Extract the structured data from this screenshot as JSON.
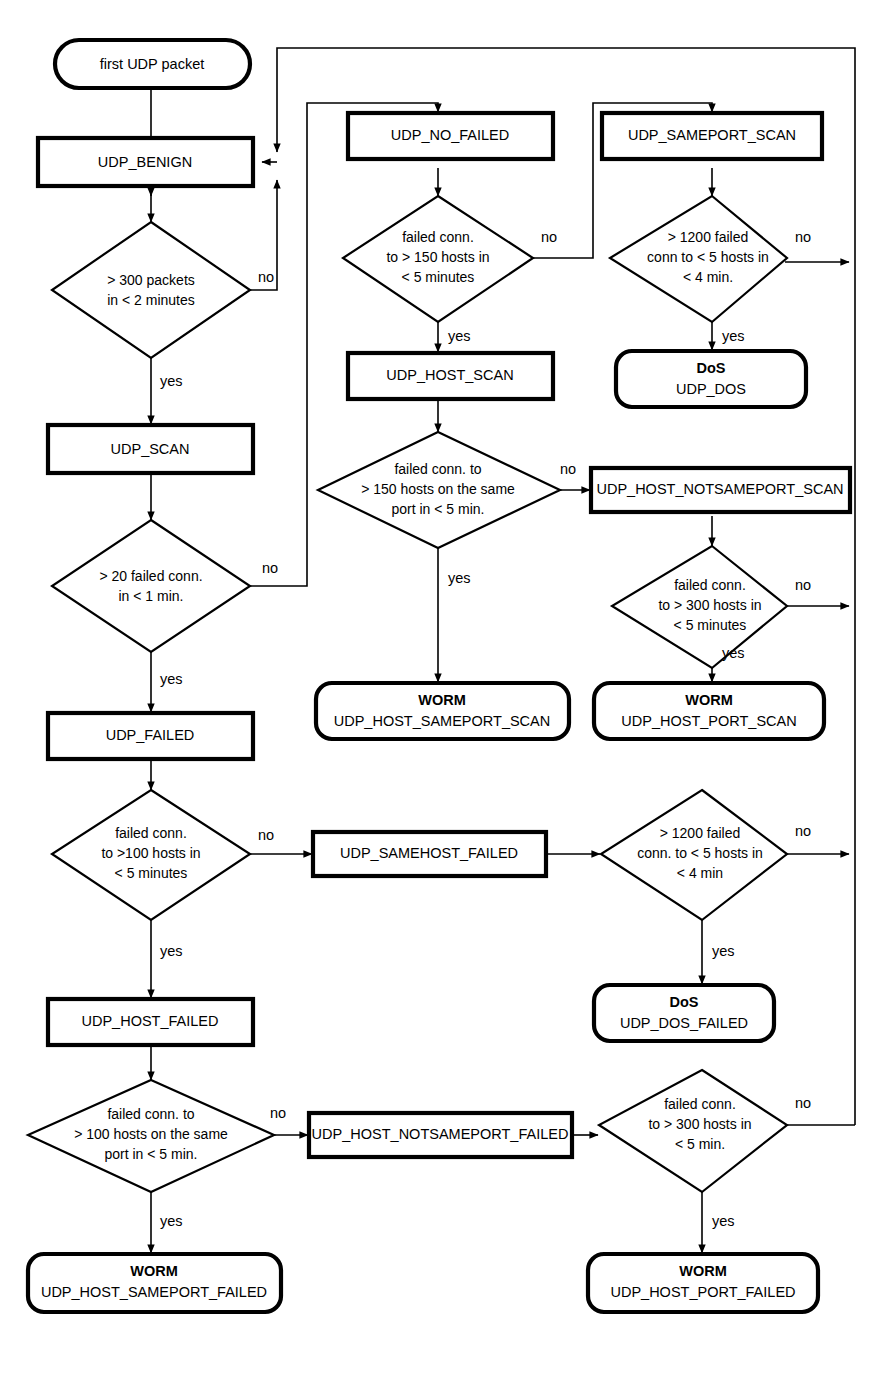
{
  "diagram": {
    "colors": {
      "stroke": "#000000",
      "fill": "#ffffff",
      "background": "#ffffff"
    },
    "edge_labels": {
      "yes": "yes",
      "no": "no"
    },
    "nodes": [
      {
        "id": "start",
        "kind": "terminator",
        "label": "first UDP packet",
        "sub": ""
      },
      {
        "id": "udp_benign",
        "kind": "state",
        "label": "UDP_BENIGN",
        "sub": ""
      },
      {
        "id": "d_300packets",
        "kind": "decision",
        "lines": [
          "> 300 packets",
          "in < 2 minutes"
        ]
      },
      {
        "id": "udp_scan",
        "kind": "state",
        "label": "UDP_SCAN",
        "sub": ""
      },
      {
        "id": "d_20failed",
        "kind": "decision",
        "lines": [
          "> 20 failed conn.",
          "in < 1 min."
        ]
      },
      {
        "id": "udp_failed",
        "kind": "state",
        "label": "UDP_FAILED",
        "sub": ""
      },
      {
        "id": "d_100hosts",
        "kind": "decision",
        "lines": [
          "failed conn.",
          "to >100 hosts in",
          "< 5 minutes"
        ]
      },
      {
        "id": "udp_host_failed",
        "kind": "state",
        "label": "UDP_HOST_FAILED",
        "sub": ""
      },
      {
        "id": "d_100sameport",
        "kind": "decision",
        "lines": [
          "failed conn. to",
          "> 100 hosts on the same",
          "port in < 5 min."
        ]
      },
      {
        "id": "worm_host_sameport_failed",
        "kind": "terminator",
        "label": "WORM",
        "sub": "UDP_HOST_SAMEPORT_FAILED"
      },
      {
        "id": "udp_samehost_failed",
        "kind": "state",
        "label": "UDP_SAMEHOST_FAILED",
        "sub": ""
      },
      {
        "id": "d_1200failed_b",
        "kind": "decision",
        "lines": [
          "> 1200 failed",
          "conn. to < 5 hosts in",
          "< 4 min"
        ]
      },
      {
        "id": "dos_failed",
        "kind": "terminator",
        "label": "DoS",
        "sub": "UDP_DOS_FAILED"
      },
      {
        "id": "udp_host_notsameport_failed",
        "kind": "state",
        "label": "UDP_HOST_NOTSAMEPORT_FAILED",
        "sub": ""
      },
      {
        "id": "d_300hosts_failed",
        "kind": "decision",
        "lines": [
          "failed conn.",
          "to > 300 hosts in",
          "< 5 min."
        ]
      },
      {
        "id": "worm_host_port_failed",
        "kind": "terminator",
        "label": "WORM",
        "sub": "UDP_HOST_PORT_FAILED"
      },
      {
        "id": "udp_no_failed",
        "kind": "state",
        "label": "UDP_NO_FAILED",
        "sub": ""
      },
      {
        "id": "d_150hosts",
        "kind": "decision",
        "lines": [
          "failed conn.",
          "to > 150 hosts in",
          "< 5 minutes"
        ]
      },
      {
        "id": "udp_host_scan",
        "kind": "state",
        "label": "UDP_HOST_SCAN",
        "sub": ""
      },
      {
        "id": "d_150sameport",
        "kind": "decision",
        "lines": [
          "failed conn. to",
          "> 150 hosts on the same",
          "port in < 5 min."
        ]
      },
      {
        "id": "worm_host_sameport_scan",
        "kind": "terminator",
        "label": "WORM",
        "sub": "UDP_HOST_SAMEPORT_SCAN"
      },
      {
        "id": "udp_sameport_scan",
        "kind": "state",
        "label": "UDP_SAMEPORT_SCAN",
        "sub": ""
      },
      {
        "id": "d_1200failed_a",
        "kind": "decision",
        "lines": [
          "> 1200 failed",
          "conn to < 5 hosts in",
          "< 4 min."
        ]
      },
      {
        "id": "dos",
        "kind": "terminator",
        "label": "DoS",
        "sub": "UDP_DOS"
      },
      {
        "id": "udp_host_notsameport_scan",
        "kind": "state",
        "label": "UDP_HOST_NOTSAMEPORT_SCAN",
        "sub": ""
      },
      {
        "id": "d_300hosts_scan",
        "kind": "decision",
        "lines": [
          "failed conn.",
          "to > 300 hosts in",
          "< 5 minutes"
        ]
      },
      {
        "id": "worm_host_port_scan",
        "kind": "terminator",
        "label": "WORM",
        "sub": "UDP_HOST_PORT_SCAN"
      }
    ],
    "edges": [
      {
        "from": "start",
        "to": "d_300packets",
        "label": ""
      },
      {
        "from": "d_300packets",
        "to": "udp_scan",
        "label": "yes"
      },
      {
        "from": "d_300packets",
        "to": "udp_benign",
        "label": "no"
      },
      {
        "from": "udp_scan",
        "to": "d_20failed",
        "label": ""
      },
      {
        "from": "d_20failed",
        "to": "udp_failed",
        "label": "yes"
      },
      {
        "from": "d_20failed",
        "to": "udp_no_failed",
        "label": "no"
      },
      {
        "from": "udp_failed",
        "to": "d_100hosts",
        "label": ""
      },
      {
        "from": "d_100hosts",
        "to": "udp_host_failed",
        "label": "yes"
      },
      {
        "from": "d_100hosts",
        "to": "udp_samehost_failed",
        "label": "no"
      },
      {
        "from": "udp_host_failed",
        "to": "d_100sameport",
        "label": ""
      },
      {
        "from": "d_100sameport",
        "to": "worm_host_sameport_failed",
        "label": "yes"
      },
      {
        "from": "d_100sameport",
        "to": "udp_host_notsameport_failed",
        "label": "no"
      },
      {
        "from": "udp_samehost_failed",
        "to": "d_1200failed_b",
        "label": ""
      },
      {
        "from": "d_1200failed_b",
        "to": "dos_failed",
        "label": "yes"
      },
      {
        "from": "d_1200failed_b",
        "to": "udp_benign",
        "label": "no"
      },
      {
        "from": "udp_host_notsameport_failed",
        "to": "d_300hosts_failed",
        "label": ""
      },
      {
        "from": "d_300hosts_failed",
        "to": "worm_host_port_failed",
        "label": "yes"
      },
      {
        "from": "d_300hosts_failed",
        "to": "udp_benign",
        "label": "no"
      },
      {
        "from": "udp_no_failed",
        "to": "d_150hosts",
        "label": ""
      },
      {
        "from": "d_150hosts",
        "to": "udp_host_scan",
        "label": "yes"
      },
      {
        "from": "d_150hosts",
        "to": "udp_sameport_scan",
        "label": "no"
      },
      {
        "from": "udp_host_scan",
        "to": "d_150sameport",
        "label": ""
      },
      {
        "from": "d_150sameport",
        "to": "worm_host_sameport_scan",
        "label": "yes"
      },
      {
        "from": "d_150sameport",
        "to": "udp_host_notsameport_scan",
        "label": "no"
      },
      {
        "from": "udp_sameport_scan",
        "to": "d_1200failed_a",
        "label": ""
      },
      {
        "from": "d_1200failed_a",
        "to": "dos",
        "label": "yes"
      },
      {
        "from": "d_1200failed_a",
        "to": "udp_benign",
        "label": "no"
      },
      {
        "from": "udp_host_notsameport_scan",
        "to": "d_300hosts_scan",
        "label": ""
      },
      {
        "from": "d_300hosts_scan",
        "to": "worm_host_port_scan",
        "label": "yes"
      },
      {
        "from": "d_300hosts_scan",
        "to": "udp_benign",
        "label": "no"
      }
    ]
  }
}
